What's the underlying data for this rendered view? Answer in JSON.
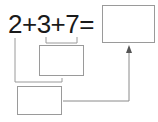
{
  "equation": {
    "text": "2+3+7=",
    "terms": [
      "2",
      "3",
      "7"
    ],
    "operators": [
      "+",
      "+",
      "="
    ]
  },
  "boxes": {
    "result": "",
    "sum_3_7": "",
    "sum_2_3": ""
  },
  "colors": {
    "text": "#1a1a1a",
    "lines": "#9a9a9a",
    "arrow": "#555555"
  }
}
